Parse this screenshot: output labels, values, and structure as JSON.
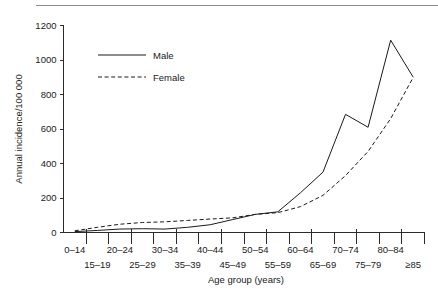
{
  "chart_data": {
    "type": "line",
    "title": "",
    "xlabel": "Age group (years)",
    "ylabel": "Annual incidence/100 000",
    "categories": [
      "0–14",
      "15–19",
      "20–24",
      "25–29",
      "30–34",
      "35–39",
      "40–44",
      "45–49",
      "50–54",
      "55–59",
      "60–64",
      "65–69",
      "70–74",
      "75–79",
      "80–84",
      "≥85"
    ],
    "ylim": [
      0,
      1200
    ],
    "yticks": [
      0,
      200,
      400,
      600,
      800,
      1000,
      1200
    ],
    "ytick_labels": [
      "0",
      "200",
      "400",
      "600",
      "800",
      "1000",
      "1200"
    ],
    "grid": false,
    "legend_position": "upper-left",
    "series": [
      {
        "name": "Male",
        "style": "solid",
        "color": "#1a1a1a",
        "values": [
          5,
          12,
          20,
          22,
          20,
          30,
          45,
          75,
          105,
          120,
          230,
          350,
          685,
          610,
          1115,
          900
        ]
      },
      {
        "name": "Female",
        "style": "dashed",
        "color": "#1a1a1a",
        "values": [
          10,
          30,
          48,
          58,
          62,
          70,
          78,
          85,
          105,
          115,
          150,
          215,
          330,
          470,
          660,
          900
        ]
      }
    ]
  },
  "legend": {
    "male_label": "Male",
    "female_label": "Female"
  },
  "axes": {
    "x_title": "Age group (years)",
    "y_title": "Annual incidence/100 000"
  }
}
